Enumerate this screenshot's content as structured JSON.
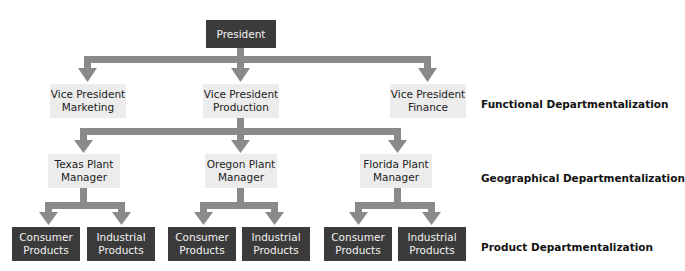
{
  "diagram": {
    "type": "organizational-chart",
    "connector_color": "#8a8a8a",
    "top": {
      "label": "President",
      "color": "#3b3b3b"
    },
    "functional": [
      {
        "label": "Vice President\nMarketing"
      },
      {
        "label": "Vice President\nProduction"
      },
      {
        "label": "Vice President\nFinance"
      }
    ],
    "geographical": [
      {
        "label": "Texas Plant\nManager"
      },
      {
        "label": "Oregon Plant\nManager"
      },
      {
        "label": "Florida Plant\nManager"
      }
    ],
    "products": [
      {
        "plant": "Texas",
        "items": [
          "Consumer\nProducts",
          "Industrial\nProducts"
        ]
      },
      {
        "plant": "Oregon",
        "items": [
          "Consumer\nProducts",
          "Industrial\nProducts"
        ]
      },
      {
        "plant": "Florida",
        "items": [
          "Consumer\nProducts",
          "Industrial\nProducts"
        ]
      }
    ],
    "level_labels": {
      "functional": "Functional Departmentalization",
      "geographical": "Geographical Departmentalization",
      "product": "Product Departmentalization"
    }
  }
}
